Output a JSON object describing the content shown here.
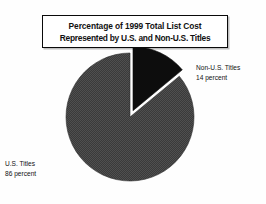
{
  "chart_data": {
    "type": "pie",
    "title": "Percentage of 1999 Total List Cost Represented by U.S. and Non-U.S. Titles",
    "title_lines": [
      "Percentage of 1999 Total List Cost",
      "Represented by U.S. and Non-U.S. Titles"
    ],
    "categories": [
      "U.S. Titles",
      "Non-U.S. Titles"
    ],
    "values": [
      86,
      14
    ],
    "unit": "percent",
    "slices": [
      {
        "label": "U.S. Titles",
        "value": 86,
        "value_text": "86 percent",
        "color": "#4a4a4a",
        "exploded": false,
        "start_angle_deg": 50.4,
        "end_angle_deg": 360
      },
      {
        "label": "Non-U.S. Titles",
        "value": 14,
        "value_text": "14 percent",
        "color": "#0d0d0d",
        "exploded": true,
        "start_angle_deg": 0,
        "end_angle_deg": 50.4
      }
    ],
    "legend_position": "callout-labels",
    "grid": false,
    "xlabel": "",
    "ylabel": ""
  },
  "title": {
    "line1": "Percentage of 1999 Total List Cost",
    "line2": "Represented by U.S. and Non-U.S. Titles"
  },
  "labels": {
    "non_us": {
      "name": "Non-U.S. Titles",
      "value": "14 percent"
    },
    "us": {
      "name": "U.S. Titles",
      "value": "86 percent"
    }
  },
  "colors": {
    "slice_us": "#4a4a4a",
    "slice_non_us": "#0d0d0d",
    "background": "#fefefe",
    "title_border": "#0a0a0a",
    "text": "#111111"
  }
}
